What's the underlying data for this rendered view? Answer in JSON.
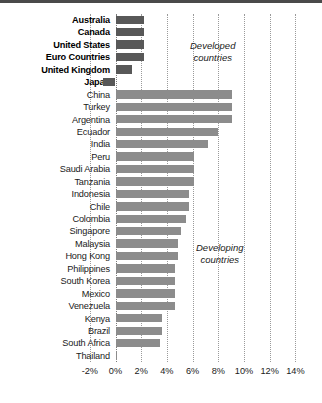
{
  "chart_data": {
    "type": "bar",
    "orientation": "horizontal",
    "title": "",
    "xlabel": "",
    "ylabel": "",
    "xlim": [
      -2,
      14
    ],
    "xticks": [
      -2,
      0,
      2,
      4,
      6,
      8,
      10,
      12,
      14
    ],
    "xtick_labels": [
      "-2%",
      "0%",
      "2%",
      "4%",
      "6%",
      "8%",
      "10%",
      "12%",
      "14%"
    ],
    "grid": true,
    "legend": "none",
    "annotations": [
      {
        "text_line1": "Developed",
        "text_line2": "countries"
      },
      {
        "text_line1": "Developing",
        "text_line2": "countries"
      }
    ],
    "categories": [
      "Australia",
      "Canada",
      "United States",
      "Euro Countries",
      "United Kingdom",
      "Japan",
      "China",
      "Turkey",
      "Argentina",
      "Ecuador",
      "India",
      "Peru",
      "Saudi Arabia",
      "Tanzania",
      "Indonesia",
      "Chile",
      "Colombia",
      "Singapore",
      "Malaysia",
      "Hong Kong",
      "Philippines",
      "South Korea",
      "Mexico",
      "Venezuela",
      "Kenya",
      "Brazil",
      "South Africa",
      "Thailand"
    ],
    "values": [
      2.2,
      2.2,
      2.2,
      2.2,
      1.3,
      -1.0,
      9.1,
      9.1,
      9.1,
      8.0,
      7.2,
      6.1,
      6.1,
      6.1,
      5.7,
      5.7,
      5.5,
      5.1,
      4.9,
      4.9,
      4.6,
      4.6,
      4.6,
      4.6,
      3.6,
      3.6,
      3.5,
      0.1
    ],
    "groups": [
      "developed",
      "developed",
      "developed",
      "developed",
      "developed",
      "developed",
      "developing",
      "developing",
      "developing",
      "developing",
      "developing",
      "developing",
      "developing",
      "developing",
      "developing",
      "developing",
      "developing",
      "developing",
      "developing",
      "developing",
      "developing",
      "developing",
      "developing",
      "developing",
      "developing",
      "developing",
      "developing",
      "developing"
    ],
    "colors": {
      "developed_bar": "#585858",
      "developing_bar": "#8c8c8c",
      "gridline": "#9a9a9a",
      "rule": "#4a4a4a",
      "text": "#1a1a1a"
    }
  }
}
